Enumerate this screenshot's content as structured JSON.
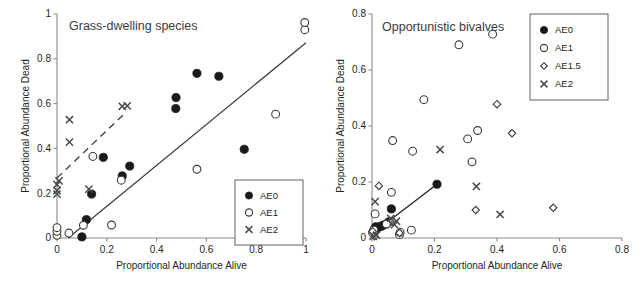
{
  "figure": {
    "panels": [
      "left",
      "right"
    ],
    "shared_axis_labels": {
      "x": "Proportional Abundance Alive",
      "y": "Proportional Abundance Dead"
    }
  },
  "chart_data": [
    {
      "type": "scatter",
      "panel": "left",
      "title": "Grass-dwelling species",
      "xlabel": "Proportional Abundance Alive",
      "ylabel": "Proportional Abundance Dead",
      "xlim": [
        0,
        1
      ],
      "ylim": [
        0,
        1
      ],
      "xticks": [
        "0",
        "0.2",
        "0.4",
        "0.6",
        "0.8",
        "1"
      ],
      "yticks": [
        "0",
        "0.2",
        "0.4",
        "0.6",
        "0.8",
        "1"
      ],
      "xtick_values": [
        0,
        0.2,
        0.4,
        0.6,
        0.8,
        1
      ],
      "ytick_values": [
        0,
        0.2,
        0.4,
        0.6,
        0.8,
        1
      ],
      "grid": false,
      "legend_position": "bottom-right",
      "legend": [
        {
          "label": "AE0",
          "marker": "filled-circle"
        },
        {
          "label": "AE1",
          "marker": "open-circle"
        },
        {
          "label": "AE2",
          "marker": "cross"
        }
      ],
      "series": [
        {
          "name": "AE0",
          "marker": "filled-circle",
          "points": [
            [
              0.1,
              0.005
            ],
            [
              0.118,
              0.082
            ],
            [
              0.139,
              0.196
            ],
            [
              0.186,
              0.36
            ],
            [
              0.262,
              0.277
            ],
            [
              0.292,
              0.321
            ],
            [
              0.477,
              0.578
            ],
            [
              0.478,
              0.627
            ],
            [
              0.562,
              0.735
            ],
            [
              0.65,
              0.722
            ],
            [
              0.752,
              0.396
            ]
          ]
        },
        {
          "name": "AE1",
          "marker": "open-circle",
          "points": [
            [
              0.0,
              0.012
            ],
            [
              0.0,
              0.03
            ],
            [
              0.0,
              0.046
            ],
            [
              0.048,
              0.022
            ],
            [
              0.106,
              0.057
            ],
            [
              0.144,
              0.364
            ],
            [
              0.219,
              0.058
            ],
            [
              0.258,
              0.258
            ],
            [
              0.562,
              0.307
            ],
            [
              0.878,
              0.553
            ],
            [
              0.995,
              0.93
            ],
            [
              0.995,
              0.962
            ]
          ]
        },
        {
          "name": "AE2",
          "marker": "cross",
          "points": [
            [
              0.0,
              0.196
            ],
            [
              0.0,
              0.212
            ],
            [
              0.0,
              0.238
            ],
            [
              0.008,
              0.255
            ],
            [
              0.05,
              0.428
            ],
            [
              0.05,
              0.528
            ],
            [
              0.128,
              0.218
            ],
            [
              0.262,
              0.588
            ],
            [
              0.282,
              0.59
            ]
          ]
        }
      ],
      "trend_lines": [
        {
          "name": "solid-regression",
          "style": "solid",
          "x0": 0.045,
          "y0": 0.0,
          "x1": 1.0,
          "y1": 0.872
        },
        {
          "name": "dashed-regression",
          "style": "dashed",
          "x0": 0.0,
          "y0": 0.268,
          "x1": 0.272,
          "y1": 0.556
        }
      ]
    },
    {
      "type": "scatter",
      "panel": "right",
      "title": "Opportunistic bivalves",
      "xlabel": "Proportional Abundance Alive",
      "ylabel": "Proportional Abundance Dead",
      "xlim": [
        0,
        0.8
      ],
      "ylim": [
        0,
        0.8
      ],
      "xticks": [
        "0",
        "0.2",
        "0.4",
        "0.6",
        "0.8"
      ],
      "yticks": [
        "0",
        "0.2",
        "0.4",
        "0.6",
        "0.8"
      ],
      "xtick_values": [
        0,
        0.2,
        0.4,
        0.6,
        0.8
      ],
      "ytick_values": [
        0,
        0.2,
        0.4,
        0.6,
        0.8
      ],
      "grid": false,
      "legend_position": "top-right",
      "legend": [
        {
          "label": "AE0",
          "marker": "filled-circle"
        },
        {
          "label": "AE1",
          "marker": "open-circle"
        },
        {
          "label": "AE1.5",
          "marker": "open-diamond"
        },
        {
          "label": "AE2",
          "marker": "cross"
        }
      ],
      "series": [
        {
          "name": "AE0",
          "marker": "filled-circle",
          "points": [
            [
              0.004,
              0.022
            ],
            [
              0.008,
              0.032
            ],
            [
              0.012,
              0.04
            ],
            [
              0.018,
              0.036
            ],
            [
              0.024,
              0.04
            ],
            [
              0.03,
              0.042
            ],
            [
              0.036,
              0.046
            ],
            [
              0.046,
              0.05
            ],
            [
              0.054,
              0.058
            ],
            [
              0.062,
              0.104
            ],
            [
              0.208,
              0.192
            ]
          ]
        },
        {
          "name": "AE1",
          "marker": "open-circle",
          "points": [
            [
              0.002,
              0.018
            ],
            [
              0.006,
              0.028
            ],
            [
              0.01,
              0.086
            ],
            [
              0.046,
              0.05
            ],
            [
              0.062,
              0.163
            ],
            [
              0.066,
              0.348
            ],
            [
              0.088,
              0.012
            ],
            [
              0.09,
              0.02
            ],
            [
              0.126,
              0.028
            ],
            [
              0.13,
              0.31
            ],
            [
              0.166,
              0.494
            ],
            [
              0.278,
              0.69
            ],
            [
              0.306,
              0.354
            ],
            [
              0.32,
              0.272
            ],
            [
              0.338,
              0.384
            ],
            [
              0.386,
              0.728
            ]
          ]
        },
        {
          "name": "AE1.5",
          "marker": "open-diamond",
          "points": [
            [
              0.002,
              0.024
            ],
            [
              0.008,
              0.006
            ],
            [
              0.022,
              0.186
            ],
            [
              0.066,
              0.06
            ],
            [
              0.088,
              0.018
            ],
            [
              0.332,
              0.1
            ],
            [
              0.4,
              0.478
            ],
            [
              0.448,
              0.374
            ],
            [
              0.58,
              0.108
            ]
          ]
        },
        {
          "name": "AE2",
          "marker": "cross",
          "points": [
            [
              0.004,
              0.006
            ],
            [
              0.01,
              0.13
            ],
            [
              0.014,
              0.01
            ],
            [
              0.06,
              0.07
            ],
            [
              0.072,
              0.048
            ],
            [
              0.078,
              0.06
            ],
            [
              0.218,
              0.316
            ],
            [
              0.334,
              0.184
            ],
            [
              0.41,
              0.084
            ]
          ]
        }
      ],
      "trend_lines": [
        {
          "name": "connector-line",
          "style": "solid",
          "x0": 0.03,
          "y0": 0.04,
          "x1": 0.208,
          "y1": 0.192
        }
      ]
    }
  ]
}
